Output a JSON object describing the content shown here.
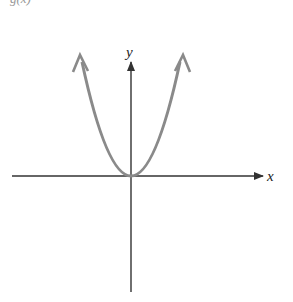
{
  "figure": {
    "caption_fragment": "g(x)",
    "x_axis_label": "x",
    "y_axis_label": "y",
    "curve": "parabola y = x^2 opening upward, vertex at origin, arrows at both ends",
    "colors": {
      "axis": "#333333",
      "curve": "#8a8a8a",
      "background": "#ffffff"
    }
  }
}
